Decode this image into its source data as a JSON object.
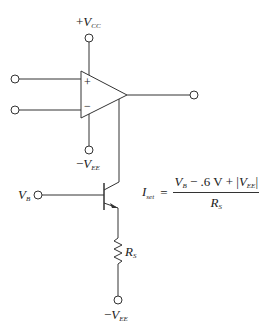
{
  "diagram": {
    "type": "circuit-schematic",
    "labels": {
      "vcc": {
        "sign": "+",
        "symbol": "V",
        "subscript": "CC"
      },
      "vee_opamp": {
        "sign": "−",
        "symbol": "V",
        "subscript": "EE"
      },
      "vb": {
        "symbol": "V",
        "subscript": "B"
      },
      "rs": {
        "symbol": "R",
        "subscript": "S"
      },
      "vee_bottom": {
        "sign": "−",
        "symbol": "V",
        "subscript": "EE"
      },
      "opamp_plus": "+",
      "opamp_minus": "−"
    },
    "formula": {
      "lhs_symbol": "I",
      "lhs_subscript": "set",
      "equals": "=",
      "numerator_vb_symbol": "V",
      "numerator_vb_subscript": "B",
      "numerator_middle": " − .6 V + |",
      "numerator_vee_symbol": "V",
      "numerator_vee_subscript": "EE",
      "numerator_end": "|",
      "denominator_symbol": "R",
      "denominator_subscript": "S"
    },
    "components": [
      "op-amp",
      "npn-transistor",
      "resistor",
      "terminals"
    ],
    "colors": {
      "line": "#333333",
      "background": "#ffffff"
    }
  }
}
